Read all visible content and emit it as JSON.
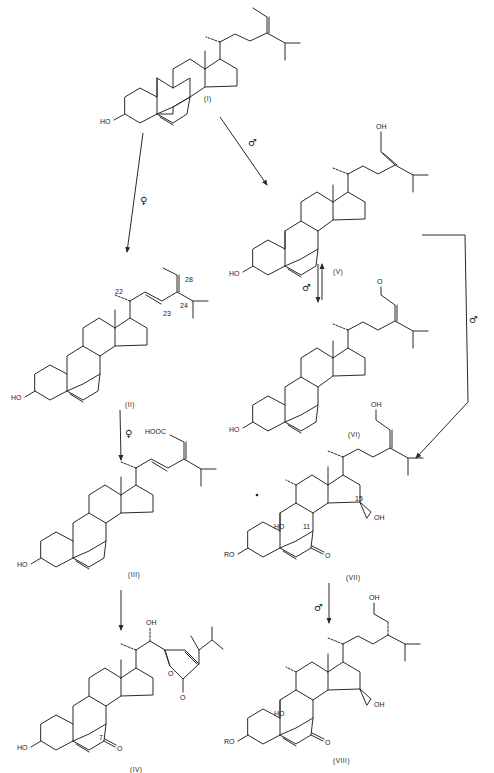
{
  "diagram": {
    "type": "reaction-scheme",
    "compounds": [
      {
        "id": "I",
        "label": "(I)",
        "substituents": [
          "HO"
        ]
      },
      {
        "id": "II",
        "label": "(II)",
        "substituents": [
          "HO"
        ],
        "atom_numbers": [
          "22",
          "23",
          "24",
          "28"
        ]
      },
      {
        "id": "III",
        "label": "(III)",
        "substituents": [
          "HO",
          "HOOC"
        ]
      },
      {
        "id": "IV",
        "label": "(IV)",
        "substituents": [
          "HO",
          "OH",
          "O",
          "O",
          "O"
        ],
        "atom_numbers": [
          "7"
        ]
      },
      {
        "id": "V",
        "label": "(V)",
        "substituents": [
          "HO",
          "OH"
        ]
      },
      {
        "id": "VI",
        "label": "(VI)",
        "substituents": [
          "HO",
          "O"
        ]
      },
      {
        "id": "VII",
        "label": "(VII)",
        "substituents": [
          "RO",
          "HO",
          "OH",
          "OH",
          "O"
        ],
        "atom_numbers": [
          "11",
          "15"
        ]
      },
      {
        "id": "VIII",
        "label": "(VIII)",
        "substituents": [
          "RO",
          "HO",
          "OH",
          "OH",
          "O"
        ]
      }
    ],
    "arrows": [
      {
        "from": "I",
        "to": "II",
        "condition": "♀"
      },
      {
        "from": "I",
        "to": "V",
        "condition": "♂"
      },
      {
        "from": "V",
        "to": "VI",
        "condition": "♂",
        "reversible": true
      },
      {
        "from": "V",
        "to": "VII",
        "condition": "♂"
      },
      {
        "from": "II",
        "to": "III",
        "condition": "♀"
      },
      {
        "from": "III",
        "to": "IV",
        "condition": ""
      },
      {
        "from": "VII",
        "to": "VIII",
        "condition": "♂"
      }
    ],
    "symbols": {
      "female": "♀",
      "male": "♂"
    }
  }
}
